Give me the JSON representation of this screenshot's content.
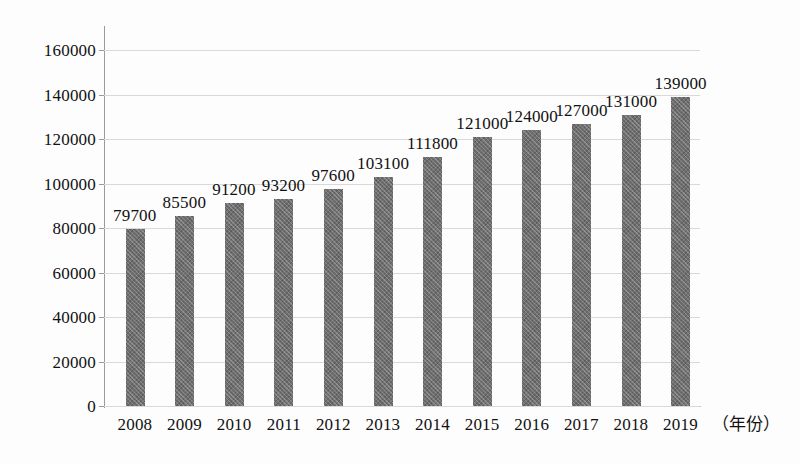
{
  "chart_data": {
    "type": "bar",
    "title": "",
    "xlabel": "（年份）",
    "ylabel": "",
    "categories": [
      "2008",
      "2009",
      "2010",
      "2011",
      "2012",
      "2013",
      "2014",
      "2015",
      "2016",
      "2017",
      "2018",
      "2019"
    ],
    "values": [
      79700,
      85500,
      91200,
      93200,
      97600,
      103100,
      111800,
      121000,
      124000,
      127000,
      131000,
      139000
    ],
    "data_labels": [
      "79700",
      "85500",
      "91200",
      "93200",
      "97600",
      "103100",
      "111800",
      "121000",
      "124000",
      "127000",
      "131000",
      "139000"
    ],
    "ylim": [
      0,
      170000
    ],
    "y_ticks": [
      0,
      20000,
      40000,
      60000,
      80000,
      100000,
      120000,
      140000,
      160000
    ],
    "y_tick_labels": [
      "0",
      "20000",
      "40000",
      "60000",
      "80000",
      "100000",
      "120000",
      "140000",
      "160000"
    ],
    "grid": true,
    "grid_axis": "y",
    "legend": false,
    "legend_position": "none",
    "series": [
      {
        "name": "",
        "values": [
          79700,
          85500,
          91200,
          93200,
          97600,
          103100,
          111800,
          121000,
          124000,
          127000,
          131000,
          139000
        ]
      }
    ]
  },
  "colors": {
    "bar_fill": "#6f6f6f",
    "gridline": "#d9d9d9",
    "axis": "#9a9a9a",
    "text": "#111111",
    "background": "#fdfdfd"
  }
}
